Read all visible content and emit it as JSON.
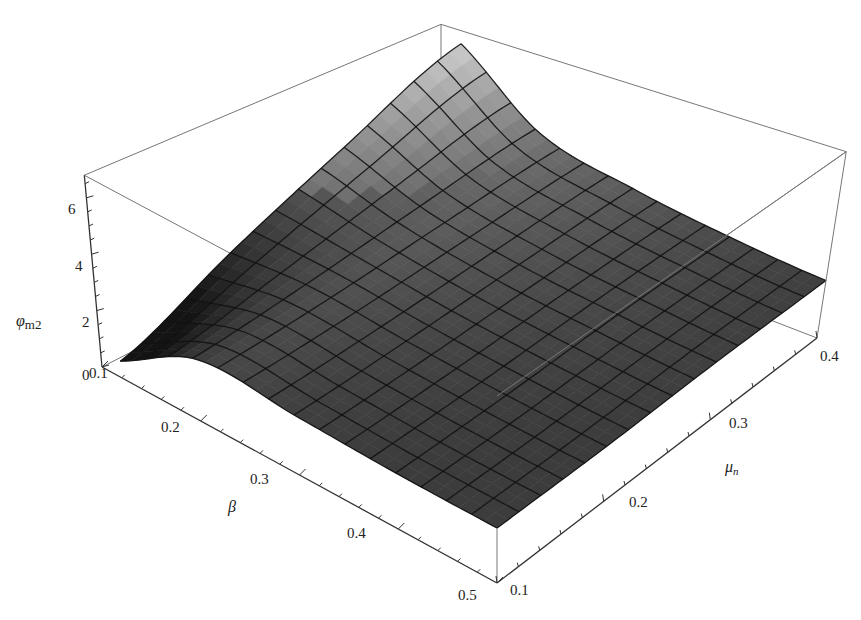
{
  "chart_data": {
    "type": "surface3d",
    "title": "",
    "xlabel": "β",
    "ylabel": "μn",
    "zlabel": "φm2",
    "x_name": "beta",
    "y_name": "mu_n",
    "xlim": [
      0.1,
      0.5
    ],
    "ylim": [
      0.1,
      0.4
    ],
    "zlim": [
      0,
      6.8
    ],
    "x_ticks": [
      "0.1",
      "0.2",
      "0.3",
      "0.4",
      "0.5"
    ],
    "y_ticks": [
      "0.1",
      "0.2",
      "0.3",
      "0.4"
    ],
    "z_ticks": [
      "0",
      "2",
      "4",
      "6"
    ],
    "mesh_divisions": 15,
    "grid": false,
    "shading": "grayscale, lighter at higher values",
    "sample_grid": {
      "beta": [
        0.1,
        0.2,
        0.3,
        0.4,
        0.5
      ],
      "mu_n": [
        0.1,
        0.2,
        0.3,
        0.4
      ],
      "z": [
        [
          0.3,
          2.4,
          4.5,
          6.7
        ],
        [
          2.2,
          2.6,
          3.2,
          3.8
        ],
        [
          2.1,
          2.3,
          2.6,
          2.9
        ],
        [
          2.0,
          2.1,
          2.3,
          2.4
        ],
        [
          2.0,
          2.0,
          2.1,
          2.1
        ]
      ]
    }
  },
  "labels": {
    "z_axis_title": "φ",
    "z_axis_sub": "m2",
    "x_axis_title": "β",
    "y_axis_title": "μ",
    "y_axis_sub": "n"
  }
}
